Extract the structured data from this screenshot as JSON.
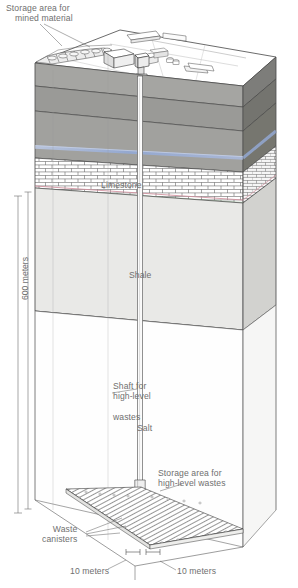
{
  "figure": {
    "type": "geological-cross-section"
  },
  "labels": {
    "storage_mined_line1": "Storage area for",
    "storage_mined_line2": "mined material",
    "limestone": "Limestone",
    "shale": "Shale",
    "salt": "Salt",
    "shaft_line1": "Shaft for",
    "shaft_line2": "high-level",
    "shaft_line3": "wastes",
    "storage_hlw_line1": "Storage area for",
    "storage_hlw_line2": "high-level wastes",
    "waste_line1": "Waste",
    "waste_line2": "canisters",
    "depth": "600 meters",
    "spacing_left": "10 meters",
    "spacing_right": "10 meters"
  },
  "strata": [
    {
      "name": "Surface soil and overburden",
      "fill": "#9c9c99"
    },
    {
      "name": "Upper rock",
      "fill": "#8f8f8c"
    },
    {
      "name": "Water-bearing rock",
      "fill": "#a0a09d"
    },
    {
      "name": "Limestone",
      "fill": "#ffffff",
      "pattern": "brick"
    },
    {
      "name": "Shale",
      "fill": "#e6e6e4"
    },
    {
      "name": "Salt",
      "fill": "#fdfdfd"
    }
  ],
  "colors": {
    "rock_top": "#a3a3a0",
    "rock_mid": "#8d8d8a",
    "rock_side_dark": "#6e6e6b",
    "water_table": "#8fa6d0",
    "limestone_seam_red": "#d79aa6",
    "limestone_seam_green": "#9dbd9d",
    "shale": "#e8e8e6",
    "salt": "#ffffff",
    "outline": "#3a3a3a",
    "label_text": "#6f6f6f",
    "canister_line": "#4a4a4a"
  },
  "measurements": {
    "depth_meters": 600,
    "canister_spacing_meters": 10
  }
}
